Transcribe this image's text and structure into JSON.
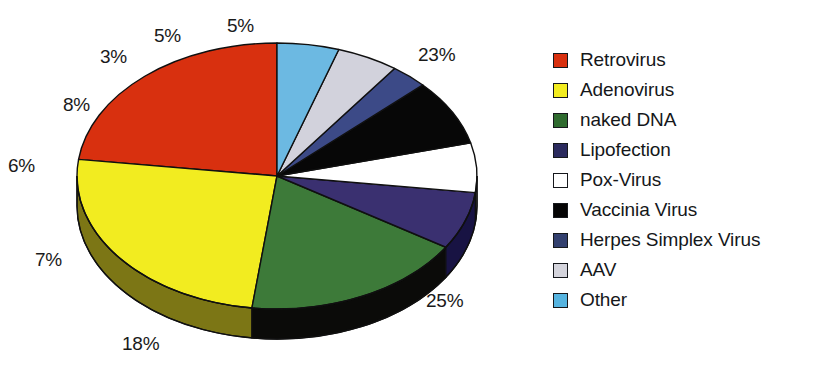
{
  "chart_data": {
    "type": "pie",
    "title": "",
    "subtitle": "",
    "xlabel": "",
    "ylabel": "",
    "grid": false,
    "legend_position": "right",
    "three_d": true,
    "start_angle_deg": 90,
    "direction": "counterclockwise",
    "categories": [
      "Retrovirus",
      "Adenovirus",
      "naked DNA",
      "Lipofection",
      "Pox-Virus",
      "Vaccinia Virus",
      "Herpes Simplex Virus",
      "AAV",
      "Other"
    ],
    "values": [
      23,
      25,
      18,
      7,
      6,
      8,
      3,
      5,
      5
    ],
    "value_labels": [
      "23%",
      "25%",
      "18%",
      "7%",
      "6%",
      "8%",
      "3%",
      "5%",
      "5%"
    ],
    "units": "percent",
    "slices": [
      {
        "label": "Retrovirus",
        "value": 23,
        "value_label": "23%",
        "color": "#d8300f",
        "side_color": "#8e1f0a"
      },
      {
        "label": "Adenovirus",
        "value": 25,
        "value_label": "25%",
        "color": "#f2ec20",
        "side_color": "#7c7615"
      },
      {
        "label": "naked DNA",
        "value": 18,
        "value_label": "18%",
        "color": "#3d7a39",
        "side_color": "#0b0b09"
      },
      {
        "label": "Lipofection",
        "value": 7,
        "value_label": "7%",
        "color": "#3a3070",
        "side_color": "#181343"
      },
      {
        "label": "Pox-Virus",
        "value": 6,
        "value_label": "6%",
        "color": "#ffffff",
        "side_color": "#b8b8b8"
      },
      {
        "label": "Vaccinia Virus",
        "value": 8,
        "value_label": "8%",
        "color": "#070707",
        "side_color": "#000000"
      },
      {
        "label": "Herpes Simplex Virus",
        "value": 3,
        "value_label": "3%",
        "color": "#3c4a87",
        "side_color": "#222c57"
      },
      {
        "label": "AAV",
        "value": 5,
        "value_label": "5%",
        "color": "#d2d2dc",
        "side_color": "#9a9aa6"
      },
      {
        "label": "Other",
        "value": 5,
        "value_label": "5%",
        "color": "#6cb9e2",
        "side_color": "#3d7fa3"
      }
    ]
  },
  "legend": {
    "items": [
      {
        "label": "Retrovirus",
        "color": "#d8300f"
      },
      {
        "label": "Adenovirus",
        "color": "#f2ec20"
      },
      {
        "label": "naked DNA",
        "color": "#2f6b2f"
      },
      {
        "label": "Lipofection",
        "color": "#2b2a5e"
      },
      {
        "label": "Pox-Virus",
        "color": "#ffffff"
      },
      {
        "label": "Vaccinia Virus",
        "color": "#050505"
      },
      {
        "label": "Herpes Simplex Virus",
        "color": "#33406f"
      },
      {
        "label": "AAV",
        "color": "#d4d4dc"
      },
      {
        "label": "Other",
        "color": "#56b4e0"
      }
    ]
  },
  "pie_labels": [
    {
      "text": "23%",
      "left": 418,
      "top": 44
    },
    {
      "text": "25%",
      "left": 426,
      "top": 290
    },
    {
      "text": "18%",
      "left": 122,
      "top": 333
    },
    {
      "text": "7%",
      "left": 35,
      "top": 249
    },
    {
      "text": "6%",
      "left": 8,
      "top": 155
    },
    {
      "text": "8%",
      "left": 63,
      "top": 94
    },
    {
      "text": "3%",
      "left": 100,
      "top": 46
    },
    {
      "text": "5%",
      "left": 154,
      "top": 25
    },
    {
      "text": "5%",
      "left": 227,
      "top": 15
    }
  ],
  "geometry": {
    "center_x": 277,
    "center_y": 176,
    "radius_x": 200,
    "radius_y": 133,
    "depth": 30
  }
}
